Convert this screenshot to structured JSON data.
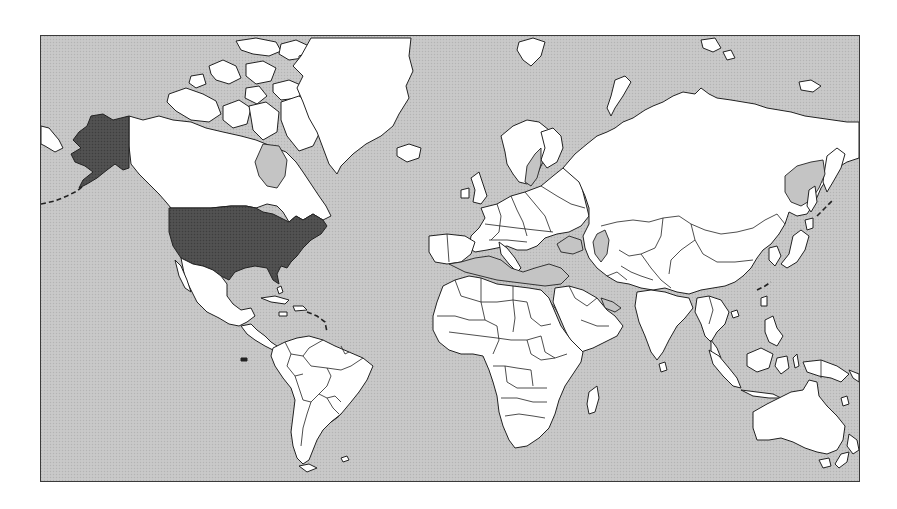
{
  "map": {
    "projection": "mercator",
    "highlighted_regions": [
      {
        "name": "United States (contiguous)",
        "fill": "#4d4d4d"
      },
      {
        "name": "Alaska",
        "fill": "#4d4d4d"
      }
    ],
    "colors": {
      "ocean": "#c4c4c4",
      "land": "#ffffff",
      "highlight": "#4d4d4d",
      "outline": "#222222",
      "frame": "#3a3a3a",
      "page_background": "#ffffff"
    },
    "labels": []
  }
}
